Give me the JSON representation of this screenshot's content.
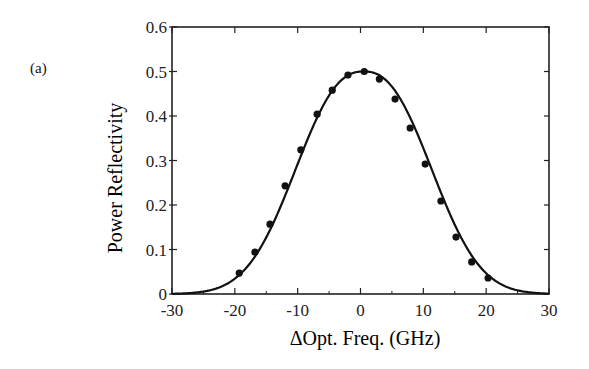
{
  "figure": {
    "panel_label": "(a)"
  },
  "chart_data": {
    "type": "line",
    "title": "",
    "xlabel": "ΔOpt. Freq.  (GHz)",
    "ylabel": "Power Reflectivity",
    "xlim": [
      -30,
      30
    ],
    "ylim": [
      0,
      0.6
    ],
    "x_ticks": [
      -30,
      -20,
      -10,
      0,
      10,
      20,
      30
    ],
    "x_tick_labels": [
      "-30",
      "-20",
      "-10",
      "0",
      "10",
      "20",
      "30"
    ],
    "x_minor_ticks": [
      -25,
      -15,
      -5,
      5,
      15,
      25
    ],
    "y_ticks": [
      0,
      0.1,
      0.2,
      0.3,
      0.4,
      0.5,
      0.6
    ],
    "y_tick_labels": [
      "0",
      "0.1",
      "0.2",
      "0.3",
      "0.4",
      "0.5",
      "0.6"
    ],
    "grid": false,
    "legend": null,
    "series": [
      {
        "name": "measured",
        "style": "markers",
        "color": "#111111",
        "x": [
          -19.3,
          -16.8,
          -14.4,
          -12.0,
          -9.5,
          -6.9,
          -4.5,
          -2.0,
          0.6,
          3.0,
          5.5,
          7.9,
          10.3,
          12.8,
          15.2,
          17.7,
          20.3
        ],
        "y": [
          0.047,
          0.094,
          0.157,
          0.243,
          0.324,
          0.404,
          0.458,
          0.492,
          0.5,
          0.483,
          0.438,
          0.373,
          0.292,
          0.209,
          0.128,
          0.072,
          0.036
        ]
      },
      {
        "name": "theory",
        "style": "line",
        "color": "#111111",
        "model": {
          "peak": 0.5,
          "center": 0.5,
          "width": 13.6,
          "exponent": 2.4
        }
      }
    ]
  }
}
